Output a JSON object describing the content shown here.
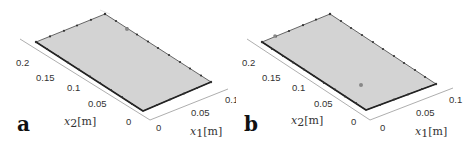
{
  "figure": {
    "panels": [
      {
        "label": "a",
        "x1_axis": {
          "label_var": "x",
          "label_sub": "1",
          "label_unit": "[m]",
          "ticks": [
            "0",
            "0.05",
            "0.1"
          ]
        },
        "x2_axis": {
          "label_var": "x",
          "label_sub": "2",
          "label_unit": "[m]",
          "ticks": [
            "0",
            "0.05",
            "0.1",
            "0.15",
            "0.2"
          ]
        },
        "plate_color": "#d3d3d3",
        "marker_note": "single marker near far edge"
      },
      {
        "label": "b",
        "x1_axis": {
          "label_var": "x",
          "label_sub": "1",
          "label_unit": "[m]",
          "ticks": [
            "0",
            "0.05",
            "0.1"
          ]
        },
        "x2_axis": {
          "label_var": "x",
          "label_sub": "2",
          "label_unit": "[m]",
          "ticks": [
            "0",
            "0.05",
            "0.1",
            "0.15",
            "0.2"
          ]
        },
        "plate_color": "#d3d3d3",
        "marker_note": "single marker on plate interior"
      }
    ]
  }
}
